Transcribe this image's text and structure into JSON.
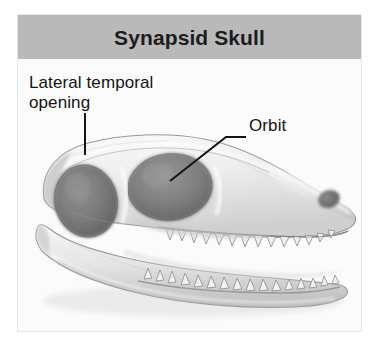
{
  "figure": {
    "title": "Synapsid Skull",
    "title_bar_color": "#b9b9b9",
    "card_background": "#fdfdfd",
    "card_border_color": "#e6e6e6",
    "page_background": "#ffffff",
    "text_color": "#141414",
    "illustration_subject": "lateral view of a synapsid reptile skull, pencil/graphite shaded drawing",
    "labels": [
      {
        "name": "lateral-temporal-opening",
        "text": "Lateral temporal\nopening",
        "leader": "vertical line down to the rear cranial opening"
      },
      {
        "name": "orbit",
        "text": "Orbit",
        "leader": "horizontal then diagonal line down-left into the eye socket"
      }
    ],
    "leader_line_color": "#1a1a1a",
    "anatomy": {
      "temporal_fenestra": "large dark oval opening behind the eye",
      "orbit": "large dark oval eye socket",
      "nostril": "small dark oval at the snout tip",
      "upper_jaw_teeth": "row of downward-pointing conical teeth",
      "lower_jaw_teeth": "row of upward-pointing conical teeth"
    }
  }
}
